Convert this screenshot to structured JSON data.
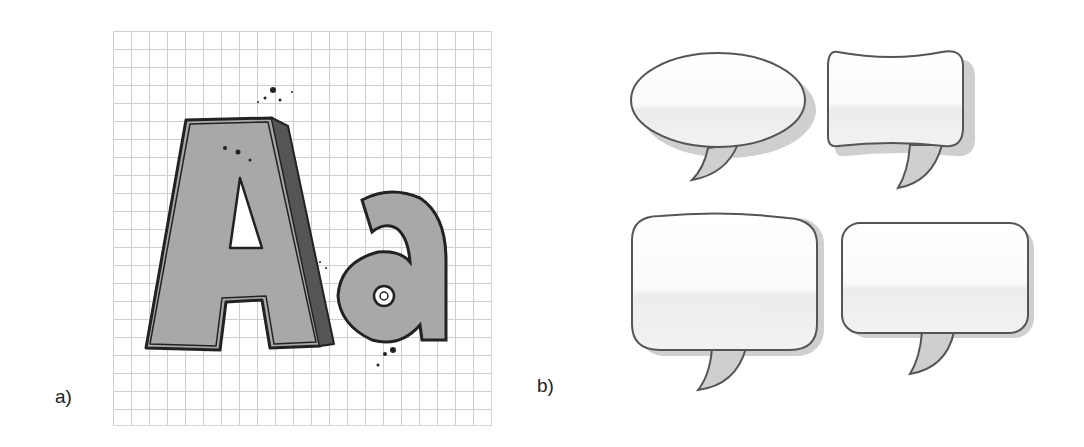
{
  "figure": {
    "panels": [
      {
        "label": "a)",
        "content": "hand-drawn letters on grid paper",
        "glyphs": "Aa"
      },
      {
        "label": "b)",
        "content": "four speech balloon shapes",
        "balloons": [
          "ellipse",
          "concave-rectangle",
          "rounded-square",
          "rounded-rectangle"
        ]
      }
    ]
  },
  "colors": {
    "letter_fill": "#a8a8a8",
    "outline": "#222222",
    "balloon_stroke": "#555555",
    "balloon_shadow": "#c8c8c8",
    "tail_fill": "#cfcfcf",
    "grid_line": "#cfcfcf"
  }
}
